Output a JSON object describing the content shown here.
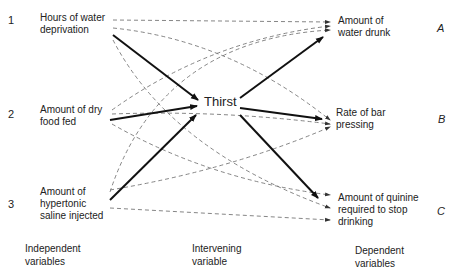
{
  "independent": {
    "heading": [
      "Independent",
      "variables"
    ],
    "items": [
      {
        "number": "1",
        "lines": [
          "Hours of water",
          "deprivation"
        ]
      },
      {
        "number": "2",
        "lines": [
          "Amount of dry",
          "food fed"
        ]
      },
      {
        "number": "3",
        "lines": [
          "Amount of",
          "hypertonic",
          "saline injected"
        ]
      }
    ]
  },
  "intervening": {
    "heading": [
      "Intervening",
      "variable"
    ],
    "label": "Thirst"
  },
  "dependent": {
    "heading": [
      "Dependent",
      "variables"
    ],
    "items": [
      {
        "letter": "A",
        "lines": [
          "Amount of",
          "water drunk"
        ]
      },
      {
        "letter": "B",
        "lines": [
          "Rate of bar",
          "pressing"
        ]
      },
      {
        "letter": "C",
        "lines": [
          "Amount of quinine",
          "required to stop",
          "drinking"
        ]
      }
    ]
  },
  "edges": {
    "solid": [
      "1→Thirst",
      "2→Thirst",
      "3→Thirst",
      "Thirst→A",
      "Thirst→B",
      "Thirst→C"
    ],
    "dashed": [
      "1→A",
      "1→B",
      "1→C",
      "2→A",
      "2→B",
      "2→C",
      "3→A",
      "3→B",
      "3→C"
    ]
  },
  "colors": {
    "solid_line": "#111111",
    "dashed_line": "#777777",
    "text": "#222222"
  }
}
